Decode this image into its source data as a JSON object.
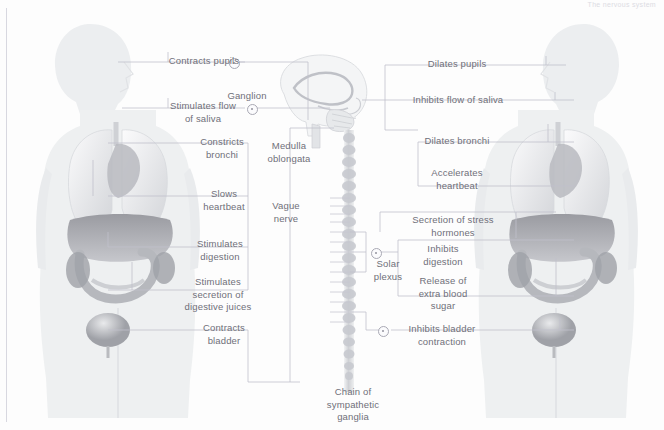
{
  "diagram": {
    "top_note": "The nervous system"
  },
  "center": {
    "brain_label": "brain",
    "medulla": "Medulla\noblongata",
    "vagus": "Vague\nnerve",
    "ganglion": "Ganglion",
    "solar_plexus": "Solar\nplexus",
    "chain": "Chain of\nsympathetic\nganglia"
  },
  "parasympathetic": {
    "side": "left",
    "labels": [
      {
        "id": "contracts-pupils",
        "text": "Contracts pupils"
      },
      {
        "id": "stimulates-saliva",
        "text": "Stimulates flow\nof saliva"
      },
      {
        "id": "constricts-bronchi",
        "text": "Constricts\nbronchi"
      },
      {
        "id": "slows-heartbeat",
        "text": "Slows\nheartbeat"
      },
      {
        "id": "stimulates-digestion",
        "text": "Stimulates\ndigestion"
      },
      {
        "id": "digestive-juices",
        "text": "Stimulates\nsecretion of\ndigestive juices"
      },
      {
        "id": "contracts-bladder",
        "text": "Contracts\nbladder"
      }
    ]
  },
  "sympathetic": {
    "side": "right",
    "labels": [
      {
        "id": "dilates-pupils",
        "text": "Dilates pupils"
      },
      {
        "id": "inhibits-saliva",
        "text": "Inhibits flow of saliva"
      },
      {
        "id": "dilates-bronchi",
        "text": "Dilates bronchi"
      },
      {
        "id": "accelerates-heartbeat",
        "text": "Accelerates\nheartbeat"
      },
      {
        "id": "stress-hormones",
        "text": "Secretion of stress\nhormones"
      },
      {
        "id": "inhibits-digestion",
        "text": "Inhibits\ndigestion"
      },
      {
        "id": "blood-sugar",
        "text": "Release of\nextra blood\nsugar"
      },
      {
        "id": "inhibits-bladder",
        "text": "Inhibits bladder\ncontraction"
      }
    ]
  },
  "colors": {
    "ink": "#6f6f79",
    "line": "#b9b9c4",
    "body": "#eef0f1",
    "organ_dark": "#8f9096"
  }
}
